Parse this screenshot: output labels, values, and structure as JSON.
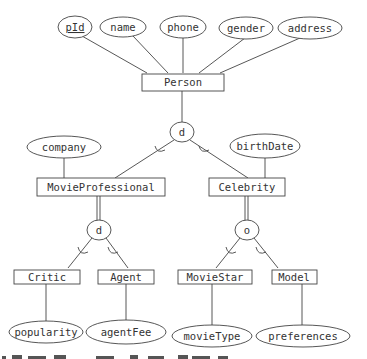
{
  "diagram": {
    "type": "EER diagram",
    "entities": {
      "person": "Person",
      "movie_professional": "MovieProfessional",
      "celebrity": "Celebrity",
      "critic": "Critic",
      "agent": "Agent",
      "movie_star": "MovieStar",
      "model": "Model"
    },
    "attributes": {
      "pid": "pId",
      "name": "name",
      "phone": "phone",
      "gender": "gender",
      "address": "address",
      "company": "company",
      "birth_date": "birthDate",
      "popularity": "popularity",
      "agent_fee": "agentFee",
      "movie_type": "movieType",
      "preferences": "preferences"
    },
    "specializations": {
      "person_spec": "d",
      "movieprof_spec": "d",
      "celebrity_spec": "o"
    },
    "relationships_summary": [
      "Person has attributes pId (key), name, phone, gender, address",
      "Person specializes (disjoint, partial) into MovieProfessional and Celebrity",
      "MovieProfessional has attribute company; Celebrity has attribute birthDate",
      "MovieProfessional specializes (disjoint, total) into Critic and Agent",
      "Celebrity specializes (overlapping, total) into MovieStar and Model",
      "Critic has popularity; Agent has agentFee; MovieStar has movieType; Model has preferences"
    ]
  }
}
